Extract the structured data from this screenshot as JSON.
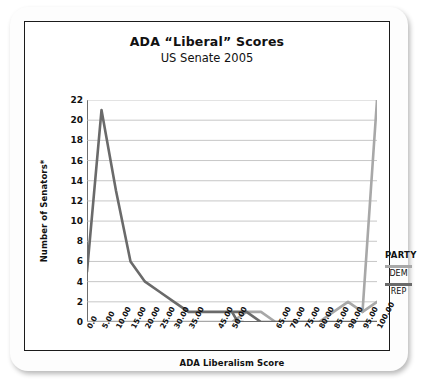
{
  "chart_data": {
    "type": "line",
    "title": "ADA “Liberal” Scores",
    "subtitle": "US Senate 2005",
    "xlabel": "ADA Liberalism Score",
    "ylabel": "Number of Senators*",
    "xlim": [
      0,
      100
    ],
    "ylim": [
      0,
      22
    ],
    "grid": true,
    "legend_position": "right",
    "legend_title": "PARTY",
    "x_tick_labels": [
      "0.0",
      "5.00",
      "10.00",
      "15.00",
      "20.00",
      "25.00",
      "30.00",
      "35.00",
      "45.00",
      "50.00",
      "65.00",
      "70.00",
      "75.00",
      "80.00",
      "85.00",
      "90.00",
      "95.00",
      "100.00"
    ],
    "x_tick_values": [
      0,
      5,
      10,
      15,
      20,
      25,
      30,
      35,
      45,
      50,
      65,
      70,
      75,
      80,
      85,
      90,
      95,
      100
    ],
    "y_tick_labels": [
      "0",
      "2",
      "4",
      "6",
      "8",
      "10",
      "12",
      "14",
      "16",
      "18",
      "20",
      "22"
    ],
    "y_tick_values": [
      0,
      2,
      4,
      6,
      8,
      10,
      12,
      14,
      16,
      18,
      20,
      22
    ],
    "x": [
      0,
      5,
      10,
      15,
      20,
      25,
      30,
      35,
      40,
      45,
      50,
      55,
      60,
      65,
      70,
      75,
      80,
      85,
      90,
      95,
      100
    ],
    "series": [
      {
        "name": "REP",
        "color": "#6a6a6a",
        "values": [
          5,
          21,
          13,
          6,
          4,
          3,
          2,
          1,
          1,
          1,
          1,
          1,
          0,
          0,
          0,
          0,
          0,
          0,
          0,
          0,
          0
        ]
      },
      {
        "name": "DEM",
        "color": "#a8a8a8",
        "values": [
          0,
          0,
          0,
          0,
          0,
          0,
          0,
          0,
          0,
          0,
          0,
          1,
          1,
          0,
          0,
          0,
          0,
          1,
          2,
          1,
          2
        ]
      }
    ],
    "combined_line": {
      "description": "Single plotted distribution curve across all senators",
      "values": [
        5,
        21,
        13,
        6,
        4,
        3,
        2,
        1,
        1,
        1,
        0,
        1,
        1,
        0,
        0,
        0,
        0,
        1,
        2,
        1,
        22
      ]
    }
  },
  "legend": {
    "title": "PARTY",
    "items": [
      {
        "label": "DEM",
        "color": "#a8a8a8"
      },
      {
        "label": "REP",
        "color": "#6a6a6a"
      }
    ]
  }
}
